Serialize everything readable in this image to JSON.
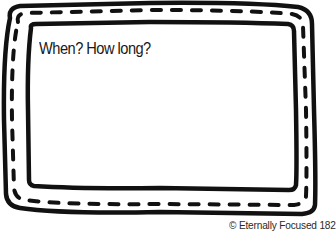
{
  "card": {
    "prompt": "When? How long?",
    "credit": "© Eternally Focused 182"
  },
  "colors": {
    "border": "#111111",
    "background": "#ffffff",
    "text": "#1a1a1a"
  },
  "icons": {
    "frame": "hand-drawn-double-border-with-stitching"
  }
}
